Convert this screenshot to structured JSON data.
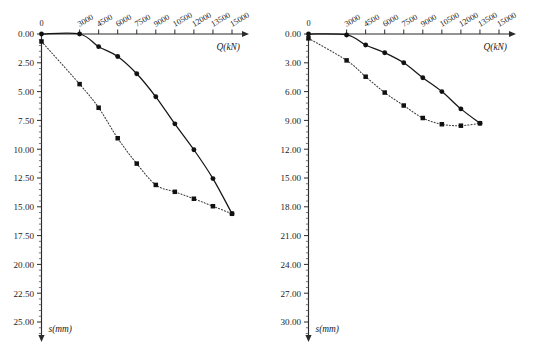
{
  "figure": {
    "background_color": "#ffffff",
    "panel_count": 2
  },
  "chart_data": [
    {
      "type": "line",
      "panel": "left",
      "title": "",
      "xlabel": "Q(kN)",
      "ylabel": "s(mm)",
      "grid": false,
      "legend": "none",
      "y_axis_inverted": true,
      "x_axis_position": "top",
      "xlim": [
        0,
        15000
      ],
      "ylim": [
        0,
        25.0
      ],
      "xticks": [
        0,
        3000,
        4500,
        6000,
        7500,
        9000,
        10500,
        12000,
        13500,
        15000
      ],
      "xtick_labels": [
        "0",
        "3000",
        "4500",
        "6000",
        "7500",
        "9000",
        "10500",
        "12000",
        "13500",
        "15000"
      ],
      "yticks": [
        0.0,
        2.5,
        5.0,
        7.5,
        10.0,
        12.5,
        15.0,
        17.5,
        20.0,
        22.5,
        25.0
      ],
      "ytick_labels": [
        "0.00",
        "2.50",
        "5.00",
        "7.50",
        "10.00",
        "12.50",
        "15.00",
        "17.50",
        "20.00",
        "22.50",
        "25.00"
      ],
      "y_minor_ticks_per_interval": 5,
      "series": [
        {
          "name": "solid-curve",
          "style": "solid",
          "marker": "filled-circle",
          "x": [
            0,
            3000,
            4500,
            6000,
            7500,
            9000,
            10500,
            12000,
            13500,
            15000
          ],
          "y": [
            0.0,
            0.0,
            1.1,
            1.95,
            3.45,
            5.45,
            7.8,
            10.05,
            12.55,
            15.6
          ]
        },
        {
          "name": "dotted-curve",
          "style": "dotted",
          "marker": "filled-square",
          "x": [
            0,
            3000,
            4500,
            6000,
            7500,
            9000,
            10500,
            12000,
            13500,
            15000
          ],
          "y": [
            0.65,
            4.35,
            6.4,
            9.05,
            11.25,
            13.1,
            13.7,
            14.3,
            14.95,
            15.6
          ]
        }
      ]
    },
    {
      "type": "line",
      "panel": "right",
      "title": "",
      "xlabel": "Q(kN)",
      "ylabel": "s(mm)",
      "grid": false,
      "legend": "none",
      "y_axis_inverted": true,
      "x_axis_position": "top",
      "xlim": [
        0,
        15000
      ],
      "ylim": [
        0,
        30.0
      ],
      "xticks": [
        0,
        3000,
        4500,
        6000,
        7500,
        9000,
        10500,
        12000,
        13500,
        15000
      ],
      "xtick_labels": [
        "0",
        "3000",
        "4500",
        "6000",
        "7500",
        "9000",
        "10500",
        "12000",
        "13500",
        "15000"
      ],
      "yticks": [
        0.0,
        3.0,
        6.0,
        9.0,
        12.0,
        15.0,
        18.0,
        21.0,
        24.0,
        27.0,
        30.0
      ],
      "ytick_labels": [
        "0.00",
        "3.00",
        "6.00",
        "9.00",
        "12.00",
        "15.00",
        "18.00",
        "21.00",
        "24.00",
        "27.00",
        "30.00"
      ],
      "y_minor_ticks_per_interval": 5,
      "series": [
        {
          "name": "solid-curve",
          "style": "solid",
          "marker": "filled-circle",
          "x": [
            0,
            3000,
            4500,
            6000,
            7500,
            9000,
            10500,
            12000,
            13500
          ],
          "y": [
            0.0,
            0.1,
            1.15,
            1.95,
            3.0,
            4.55,
            6.0,
            7.8,
            9.3
          ]
        },
        {
          "name": "dotted-curve",
          "style": "dotted",
          "marker": "filled-square",
          "x": [
            0,
            3000,
            4500,
            6000,
            7500,
            9000,
            10500,
            12000,
            13500
          ],
          "y": [
            0.45,
            2.75,
            4.45,
            6.1,
            7.45,
            8.75,
            9.4,
            9.55,
            9.3
          ]
        }
      ]
    }
  ]
}
